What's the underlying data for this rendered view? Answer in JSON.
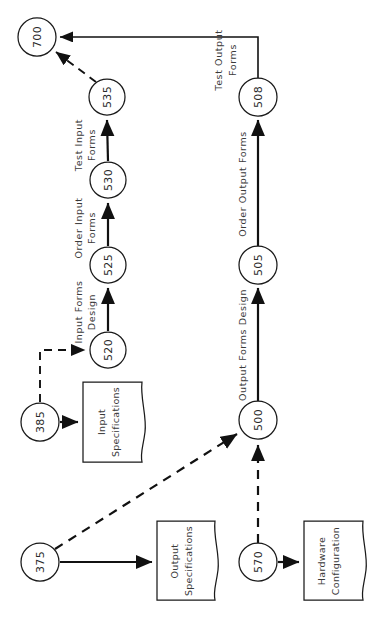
{
  "diagram": {
    "type": "pert-network-rotated",
    "orientation": "text rotated 90 degrees counter-clockwise",
    "nodes": [
      {
        "id": "700",
        "label": "700",
        "cx": 37,
        "cy": 37,
        "r": 19
      },
      {
        "id": "535",
        "label": "535",
        "cx": 107,
        "cy": 97,
        "r": 18
      },
      {
        "id": "530",
        "label": "530",
        "cx": 108,
        "cy": 180,
        "r": 18
      },
      {
        "id": "525",
        "label": "525",
        "cx": 108,
        "cy": 265,
        "r": 18
      },
      {
        "id": "520",
        "label": "520",
        "cx": 108,
        "cy": 350,
        "r": 18
      },
      {
        "id": "385",
        "label": "385",
        "cx": 40,
        "cy": 422,
        "r": 19
      },
      {
        "id": "375",
        "label": "375",
        "cx": 40,
        "cy": 562,
        "r": 19
      },
      {
        "id": "508",
        "label": "508",
        "cx": 258,
        "cy": 97,
        "r": 19
      },
      {
        "id": "505",
        "label": "505",
        "cx": 258,
        "cy": 265,
        "r": 19
      },
      {
        "id": "500",
        "label": "500",
        "cx": 258,
        "cy": 420,
        "r": 19
      },
      {
        "id": "570",
        "label": "570",
        "cx": 258,
        "cy": 562,
        "r": 19
      }
    ],
    "documents": [
      {
        "id": "input-specifications",
        "lines": [
          "Input",
          "Specifications"
        ],
        "x": 83,
        "y": 382,
        "w": 59,
        "h": 80
      },
      {
        "id": "output-specifications",
        "lines": [
          "Output",
          "Specifications"
        ],
        "x": 157,
        "y": 521,
        "w": 58,
        "h": 79
      },
      {
        "id": "hardware-configuration",
        "lines": [
          "Hardware",
          "Configuration"
        ],
        "x": 304,
        "y": 521,
        "w": 59,
        "h": 79
      }
    ],
    "edge_labels": [
      {
        "id": "test-input-forms",
        "lines": [
          "Test Input",
          "Forms"
        ],
        "x": 82,
        "y": 139
      },
      {
        "id": "order-input-forms",
        "lines": [
          "Order Input",
          "Forms"
        ],
        "x": 82,
        "y": 222
      },
      {
        "id": "input-forms-design",
        "lines": [
          "Input Forms",
          "Design"
        ],
        "x": 82,
        "y": 307
      },
      {
        "id": "test-output-forms",
        "lines": [
          "Test Output",
          "Forms"
        ],
        "x": 227,
        "y": 60
      },
      {
        "id": "order-output-forms",
        "lines": [
          "Order Output Forms"
        ],
        "x": 241,
        "y": 181
      },
      {
        "id": "output-forms-design",
        "lines": [
          "Output Forms Design"
        ],
        "x": 241,
        "y": 342
      }
    ],
    "edges": [
      {
        "id": "e-535-700",
        "from": "535",
        "to": "700",
        "style": "dashed"
      },
      {
        "id": "e-530-535",
        "from": "530",
        "to": "535",
        "style": "solid",
        "label": "test-input-forms"
      },
      {
        "id": "e-525-530",
        "from": "525",
        "to": "530",
        "style": "solid",
        "label": "order-input-forms"
      },
      {
        "id": "e-520-525",
        "from": "520",
        "to": "525",
        "style": "solid",
        "label": "input-forms-design"
      },
      {
        "id": "e-385-520",
        "from": "385",
        "to": "520",
        "style": "dashed"
      },
      {
        "id": "e-385-inputspec",
        "from": "385",
        "to": "input-specifications",
        "style": "solid"
      },
      {
        "id": "e-508-700",
        "from": "508",
        "to": "700",
        "style": "solid",
        "label": "test-output-forms"
      },
      {
        "id": "e-505-508",
        "from": "505",
        "to": "508",
        "style": "solid",
        "label": "order-output-forms"
      },
      {
        "id": "e-500-505",
        "from": "500",
        "to": "505",
        "style": "solid",
        "label": "output-forms-design"
      },
      {
        "id": "e-375-500",
        "from": "375",
        "to": "500",
        "style": "dashed"
      },
      {
        "id": "e-375-outputspec",
        "from": "375",
        "to": "output-specifications",
        "style": "solid"
      },
      {
        "id": "e-570-500",
        "from": "570",
        "to": "500",
        "style": "dashed"
      },
      {
        "id": "e-570-hardware",
        "from": "570",
        "to": "hardware-configuration",
        "style": "solid"
      }
    ],
    "colors": {
      "background": "#ffffff",
      "stroke": "#111111",
      "node_stroke": "#1a1a1a",
      "text": "#2a2a2a"
    }
  }
}
